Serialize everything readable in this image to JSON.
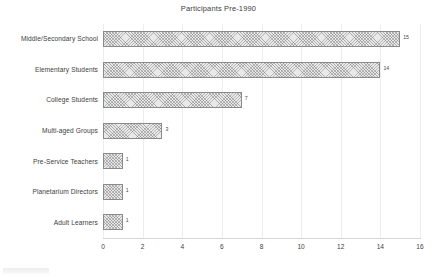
{
  "chart_data": {
    "type": "bar",
    "orientation": "horizontal",
    "title": "Participants Pre-1990",
    "xlabel": "",
    "ylabel": "",
    "xlim": [
      0,
      16
    ],
    "xticks": [
      "0",
      "2",
      "4",
      "6",
      "8",
      "10",
      "12",
      "14",
      "16"
    ],
    "grid": true,
    "legend": false,
    "categories": [
      "Middle/Secondary School",
      "Elementary Students",
      "College Students",
      "Multi-aged Groups",
      "Pre-Service Teachers",
      "Planetarium Directors",
      "Adult Learners"
    ],
    "values": [
      15,
      14,
      7,
      3,
      1,
      1,
      1
    ],
    "data_labels": [
      "15",
      "14",
      "7",
      "3",
      "1",
      "1",
      "1"
    ],
    "bar_fill": "#e9e9e9",
    "bar_pattern": "crosshatch",
    "bar_border_color": "#8a8a8a",
    "gridline_color": "#ededed",
    "axis_color": "#d6d6d6",
    "text_color": "#3d3d3d"
  }
}
